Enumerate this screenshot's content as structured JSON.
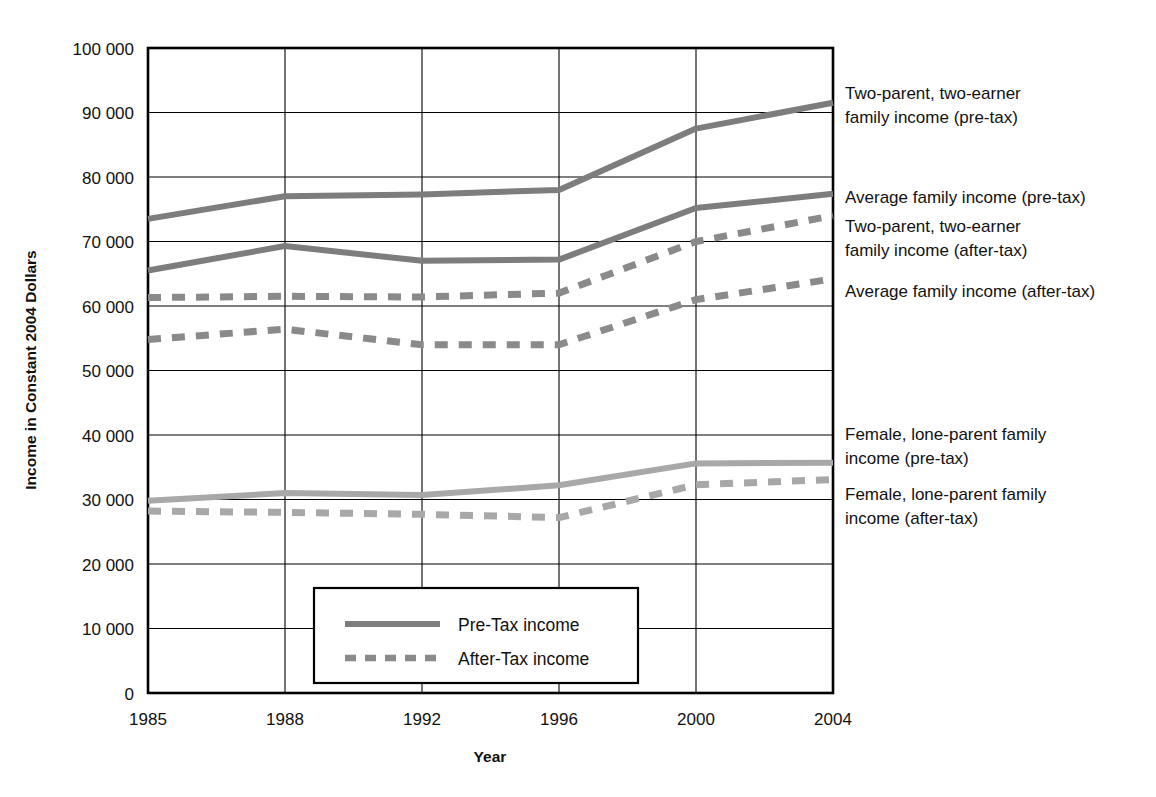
{
  "chart_data": {
    "type": "line",
    "title": "",
    "xlabel": "Year",
    "ylabel": "Income in Constant 2004 Dollars",
    "categories": [
      "1985",
      "1988",
      "1992",
      "1996",
      "2000",
      "2004"
    ],
    "x_tick_labels": [
      "1985",
      "1988",
      "1992",
      "1996",
      "2000",
      "2004"
    ],
    "y_tick_labels": [
      "0",
      "10 000",
      "20 000",
      "30 000",
      "40 000",
      "50 000",
      "60 000",
      "70 000",
      "80 000",
      "90 000",
      "100 000"
    ],
    "y_tick_values": [
      0,
      10000,
      20000,
      30000,
      40000,
      50000,
      60000,
      70000,
      80000,
      90000,
      100000
    ],
    "ylim": [
      0,
      100000
    ],
    "grid": true,
    "legend_position": "inside-bottom-center",
    "series": [
      {
        "name": "Two-parent, two-earner family income (pre-tax)",
        "style": "solid",
        "color": "#7d7d7d",
        "values": [
          73500,
          77000,
          77300,
          78000,
          87500,
          91500
        ]
      },
      {
        "name": "Average family income (pre-tax)",
        "style": "solid",
        "color": "#7d7d7d",
        "values": [
          65500,
          69300,
          67000,
          67200,
          75200,
          77400
        ]
      },
      {
        "name": "Two-parent, two-earner family income (after-tax)",
        "style": "dashed",
        "color": "#8a8a8a",
        "values": [
          61300,
          61500,
          61400,
          62000,
          70000,
          74000
        ]
      },
      {
        "name": "Average family income (after-tax)",
        "style": "dashed",
        "color": "#8a8a8a",
        "values": [
          54800,
          56400,
          54000,
          54000,
          61000,
          64200
        ]
      },
      {
        "name": "Female, lone-parent family income (pre-tax)",
        "style": "solid",
        "color": "#a8a8a8",
        "values": [
          29800,
          31000,
          30700,
          32200,
          35600,
          35700
        ]
      },
      {
        "name": "Female, lone-parent family income (after-tax)",
        "style": "dashed",
        "color": "#a8a8a8",
        "values": [
          28200,
          28000,
          27700,
          27200,
          32300,
          33100
        ]
      }
    ],
    "legend_entries": [
      {
        "label": "Pre-Tax income",
        "style": "solid"
      },
      {
        "label": "After-Tax income",
        "style": "dashed"
      }
    ],
    "annotations": [
      {
        "id": "ann-two-parent-pre",
        "lines": [
          "Two-parent, two-earner",
          "family income (pre-tax)"
        ]
      },
      {
        "id": "ann-average-pre",
        "lines": [
          "Average family income (pre-tax)"
        ]
      },
      {
        "id": "ann-two-parent-after",
        "lines": [
          "Two-parent, two-earner",
          "family income (after-tax)"
        ]
      },
      {
        "id": "ann-average-after",
        "lines": [
          "Average family income (after-tax)"
        ]
      },
      {
        "id": "ann-female-pre",
        "lines": [
          "Female, lone-parent family",
          "income (pre-tax)"
        ]
      },
      {
        "id": "ann-female-after",
        "lines": [
          "Female, lone-parent family",
          "income (after-tax)"
        ]
      }
    ]
  },
  "labels": {
    "y_title": "Income in Constant 2004 Dollars",
    "x_title": "Year",
    "y0": "0",
    "y1": "10 000",
    "y2": "20 000",
    "y3": "30 000",
    "y4": "40 000",
    "y5": "50 000",
    "y6": "60 000",
    "y7": "70 000",
    "y8": "80 000",
    "y9": "90 000",
    "y10": "100 000",
    "x0": "1985",
    "x1": "1988",
    "x2": "1992",
    "x3": "1996",
    "x4": "2000",
    "x5": "2004"
  },
  "annotation_text": {
    "two_parent_pre_l1": "Two-parent, two-earner",
    "two_parent_pre_l2": "family income (pre-tax)",
    "average_pre_l1": "Average family income (pre-tax)",
    "two_parent_after_l1": "Two-parent, two-earner",
    "two_parent_after_l2": "family income (after-tax)",
    "average_after_l1": "Average family income (after-tax)",
    "female_pre_l1": "Female, lone-parent family",
    "female_pre_l2": "income (pre-tax)",
    "female_after_l1": "Female, lone-parent family",
    "female_after_l2": "income (after-tax)"
  },
  "legend": {
    "pre_tax": "Pre-Tax income",
    "after_tax": "After-Tax income"
  },
  "colors": {
    "pre_tax_dark": "#7d7d7d",
    "after_tax_dark": "#8a8a8a",
    "light_gray": "#a8a8a8",
    "axis": "#000000",
    "grid": "#000000",
    "background": "#ffffff"
  }
}
